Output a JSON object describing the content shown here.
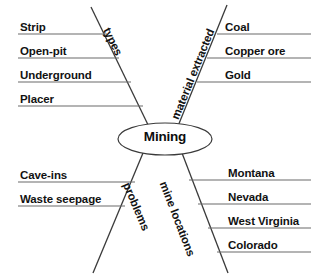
{
  "diagram": {
    "type": "fishbone",
    "center_topic": "Mining",
    "background_color": "#ffffff",
    "line_color": "#6b6b6b",
    "text_color": "#121212",
    "branches": [
      {
        "id": "types",
        "category_label": "types",
        "position": "top-left",
        "items": [
          "Strip",
          "Open-pit",
          "Underground",
          "Placer"
        ]
      },
      {
        "id": "material-extracted",
        "category_label": "material extracted",
        "position": "top-right",
        "items": [
          "Coal",
          "Copper ore",
          "Gold"
        ]
      },
      {
        "id": "problems",
        "category_label": "problems",
        "position": "bottom-left",
        "items": [
          "Cave-ins",
          "Waste seepage"
        ]
      },
      {
        "id": "mine-locations",
        "category_label": "mine locations",
        "position": "bottom-right",
        "items": [
          "Montana",
          "Nevada",
          "West Virginia",
          "Colorado"
        ]
      }
    ]
  }
}
